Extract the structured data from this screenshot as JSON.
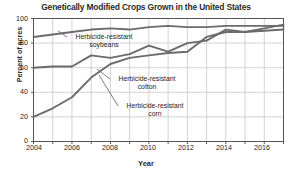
{
  "chart_data": {
    "type": "line",
    "title": "Genetically Modified Crops Grown in the United States",
    "xlabel": "Year",
    "ylabel": "Percent of acres",
    "xlim": [
      2004,
      2017
    ],
    "ylim": [
      0,
      100
    ],
    "grid": true,
    "legend_position": "inline-annotations",
    "x": [
      2004,
      2005,
      2006,
      2007,
      2008,
      2009,
      2010,
      2011,
      2012,
      2013,
      2014,
      2015,
      2016,
      2017
    ],
    "xticks": [
      2004,
      2005,
      2006,
      2007,
      2008,
      2009,
      2010,
      2011,
      2012,
      2013,
      2014,
      2015,
      2016,
      2017
    ],
    "xtick_labels": [
      "2004",
      "2006",
      "2008",
      "2010",
      "2012",
      "2014",
      "2016"
    ],
    "xtick_label_values": [
      2004,
      2006,
      2008,
      2010,
      2012,
      2014,
      2016
    ],
    "yticks": [
      0,
      20,
      40,
      60,
      80,
      100
    ],
    "ytick_labels": [
      "0",
      "20",
      "40",
      "60",
      "80",
      "100"
    ],
    "series": [
      {
        "name": "Herbicide-resistant soybeans",
        "color": "#6b6b6b",
        "values": [
          85,
          87,
          89,
          91,
          92,
          91,
          93,
          94,
          93,
          93,
          94,
          94,
          94,
          94
        ]
      },
      {
        "name": "Herbicide-resistant cotton",
        "color": "#6b6b6b",
        "values": [
          60,
          61,
          61,
          70,
          68,
          71,
          78,
          73,
          80,
          82,
          91,
          89,
          92,
          95
        ]
      },
      {
        "name": "Herbicide-resistant corn",
        "color": "#6b6b6b",
        "values": [
          20,
          27,
          36,
          52,
          63,
          68,
          70,
          72,
          73,
          85,
          89,
          89,
          90,
          91
        ]
      }
    ],
    "annotations": [
      {
        "id": "soybeans",
        "line1": "Herbicide-resistant",
        "line2": "soybeans"
      },
      {
        "id": "cotton",
        "line1": "Herbicide-resistant",
        "line2": "cotton"
      },
      {
        "id": "corn",
        "line1": "Herbicide-resistant",
        "line2": "corn"
      }
    ]
  },
  "colors": {
    "line": "#6b6b6b",
    "grid": "#c8c8c8",
    "axis": "#555555",
    "text": "#1d1d1d",
    "title": "#2b2b2b"
  }
}
